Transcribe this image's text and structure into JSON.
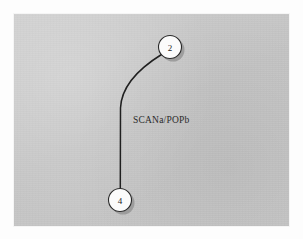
{
  "figure": {
    "type": "state-transition-graph",
    "background_color": "#c9c9c9",
    "page_color": "#ffffff",
    "ink_color": "#1e1e1e",
    "node_fill_color": "#fbfbfb",
    "shadow_color": "#8d8d8d"
  },
  "nodes": [
    {
      "id": "node-2",
      "label": "2",
      "cx": 170,
      "cy": 47,
      "r": 11.5
    },
    {
      "id": "node-4",
      "label": "4",
      "cx": 120,
      "cy": 200,
      "r": 11.5
    }
  ],
  "edges": [
    {
      "id": "edge-2-4",
      "from": "2",
      "to": "4",
      "label": "SCANa/POPb",
      "label_x": 133,
      "label_y": 123
    }
  ]
}
